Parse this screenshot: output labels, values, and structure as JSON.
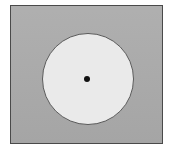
{
  "figure": {
    "name": "circle-in-square-diagram",
    "canvas": {
      "width": 171,
      "height": 154,
      "background_color": "#ffffff"
    },
    "shapes": [
      {
        "name": "outer-square",
        "type": "rectangle",
        "fill_color": "#ababab",
        "stroke_color": "#4a4a4a",
        "stroke_width": 1,
        "x": 10,
        "y": 5,
        "width": 153,
        "height": 139,
        "label": ""
      },
      {
        "name": "inner-circle",
        "type": "circle",
        "fill_color": "#eaeaea",
        "stroke_color": "#5a5a5a",
        "stroke_width": 1,
        "center_x": 87,
        "center_y": 78,
        "radius_x": 46,
        "radius_y": 46,
        "label": ""
      },
      {
        "name": "center-dot",
        "type": "circle",
        "fill_color": "#111111",
        "stroke_color": "#111111",
        "stroke_width": 0,
        "center_x": 86,
        "center_y": 78,
        "radius_x": 3,
        "radius_y": 3,
        "label": ""
      }
    ]
  }
}
